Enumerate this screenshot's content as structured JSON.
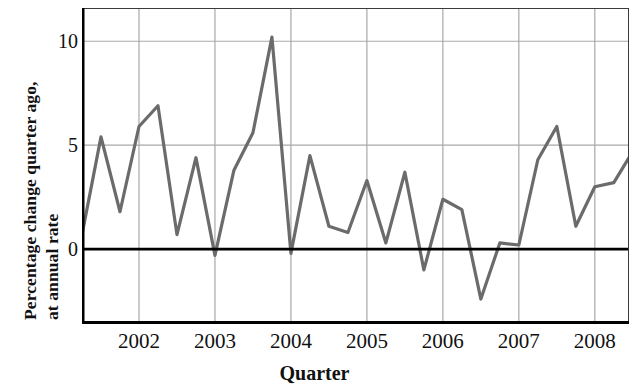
{
  "chart_data": {
    "type": "line",
    "title": "",
    "xlabel": "Quarter",
    "ylabel": "Percentage change quarter ago, at annual rate",
    "ylabel_line1": "Percentage change quarter ago,",
    "ylabel_line2": "at annual rate",
    "ytick_labels": [
      "10",
      "5",
      "0"
    ],
    "ytick_values": [
      10,
      5,
      0
    ],
    "ylim": [
      -3.6,
      11.6
    ],
    "xtick_labels": [
      "2002",
      "2003",
      "2004",
      "2005",
      "2006",
      "2007",
      "2008"
    ],
    "xtick_values": [
      2002,
      2003,
      2004,
      2005,
      2006,
      2007,
      2008
    ],
    "xlim": [
      2001.25,
      2008.45
    ],
    "grid": true,
    "grid_color": "#a8a8a8",
    "zero_line": 0,
    "zero_line_color": "#000000",
    "line_color": "#6b6b6b",
    "line_width": 3.2,
    "legend": null,
    "x": [
      2001.25,
      2001.5,
      2001.75,
      2002.0,
      2002.25,
      2002.5,
      2002.75,
      2003.0,
      2003.25,
      2003.5,
      2003.75,
      2004.0,
      2004.25,
      2004.5,
      2004.75,
      2005.0,
      2005.25,
      2005.5,
      2005.75,
      2006.0,
      2006.25,
      2006.5,
      2006.75,
      2007.0,
      2007.25,
      2007.5,
      2007.75,
      2008.0,
      2008.25,
      2008.45
    ],
    "values": [
      0.7,
      5.4,
      1.8,
      5.9,
      6.9,
      0.7,
      4.4,
      -0.3,
      3.8,
      5.6,
      10.2,
      -0.2,
      4.5,
      1.1,
      0.8,
      3.3,
      0.3,
      3.7,
      -1.0,
      2.4,
      1.9,
      -2.4,
      0.3,
      0.2,
      4.3,
      5.9,
      1.1,
      3.0,
      3.2,
      4.4
    ],
    "series": [
      {
        "name": "Percentage change quarter ago, at annual rate",
        "values": [
          0.7,
          5.4,
          1.8,
          5.9,
          6.9,
          0.7,
          4.4,
          -0.3,
          3.8,
          5.6,
          10.2,
          -0.2,
          4.5,
          1.1,
          0.8,
          3.3,
          0.3,
          3.7,
          -1.0,
          2.4,
          1.9,
          -2.4,
          0.3,
          0.2,
          4.3,
          5.9,
          1.1,
          3.0,
          3.2,
          4.4
        ]
      }
    ]
  }
}
